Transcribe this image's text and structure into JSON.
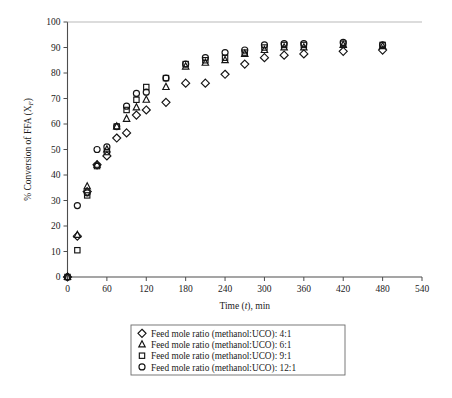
{
  "chart_data": {
    "type": "scatter",
    "title": "",
    "xlabel": "Time (t), min",
    "ylabel": "% Conversion of FFA (XF)",
    "ylabel_main": "% Conversion of FFA (X",
    "ylabel_sub": "F",
    "ylabel_tail": ")",
    "xlabel_pre": "Time (",
    "xlabel_it": "t",
    "xlabel_post": "), min",
    "xlim": [
      0,
      540
    ],
    "ylim": [
      0,
      100
    ],
    "xticks": [
      0,
      60,
      120,
      180,
      240,
      300,
      360,
      420,
      480,
      540
    ],
    "yticks": [
      0,
      10,
      20,
      30,
      40,
      50,
      60,
      70,
      80,
      90,
      100
    ],
    "grid": false,
    "legend_position": "below-plot",
    "series": [
      {
        "name": "Feed mole ratio (methanol:UCO): 4:1",
        "label_pre": "Feed mole ratio (methanol:UCO): ",
        "ratio": "4:1",
        "marker": "diamond",
        "points": [
          {
            "x": 0,
            "y": 0
          },
          {
            "x": 15,
            "y": 16
          },
          {
            "x": 30,
            "y": 33.5
          },
          {
            "x": 45,
            "y": 44
          },
          {
            "x": 60,
            "y": 47.5
          },
          {
            "x": 75,
            "y": 54.5
          },
          {
            "x": 90,
            "y": 56.5
          },
          {
            "x": 105,
            "y": 63.5
          },
          {
            "x": 120,
            "y": 65.5
          },
          {
            "x": 150,
            "y": 68.5
          },
          {
            "x": 180,
            "y": 76
          },
          {
            "x": 210,
            "y": 76
          },
          {
            "x": 240,
            "y": 79.5
          },
          {
            "x": 270,
            "y": 83.5
          },
          {
            "x": 300,
            "y": 86
          },
          {
            "x": 330,
            "y": 87
          },
          {
            "x": 360,
            "y": 87.5
          },
          {
            "x": 420,
            "y": 88.5
          },
          {
            "x": 480,
            "y": 89
          }
        ]
      },
      {
        "name": "Feed mole ratio (methanol:UCO): 6:1",
        "label_pre": "Feed mole ratio (methanol:UCO): ",
        "ratio": "6:1",
        "marker": "triangle",
        "points": [
          {
            "x": 0,
            "y": 0
          },
          {
            "x": 15,
            "y": 16.5
          },
          {
            "x": 30,
            "y": 35.5
          },
          {
            "x": 45,
            "y": 44
          },
          {
            "x": 60,
            "y": 50
          },
          {
            "x": 75,
            "y": 59
          },
          {
            "x": 90,
            "y": 62
          },
          {
            "x": 105,
            "y": 66.5
          },
          {
            "x": 120,
            "y": 69.5
          },
          {
            "x": 150,
            "y": 74.5
          },
          {
            "x": 180,
            "y": 82.5
          },
          {
            "x": 210,
            "y": 84
          },
          {
            "x": 240,
            "y": 85
          },
          {
            "x": 270,
            "y": 87.5
          },
          {
            "x": 300,
            "y": 89
          },
          {
            "x": 330,
            "y": 90
          },
          {
            "x": 360,
            "y": 90
          },
          {
            "x": 420,
            "y": 91
          },
          {
            "x": 480,
            "y": 90.5
          }
        ]
      },
      {
        "name": "Feed mole ratio (methanol:UCO): 9:1",
        "label_pre": "Feed mole ratio (methanol:UCO): ",
        "ratio": "9:1",
        "marker": "square",
        "points": [
          {
            "x": 0,
            "y": 0
          },
          {
            "x": 15,
            "y": 10.5
          },
          {
            "x": 30,
            "y": 32
          },
          {
            "x": 45,
            "y": 43.5
          },
          {
            "x": 60,
            "y": 49
          },
          {
            "x": 75,
            "y": 59
          },
          {
            "x": 90,
            "y": 65.5
          },
          {
            "x": 105,
            "y": 69.5
          },
          {
            "x": 120,
            "y": 74.5
          },
          {
            "x": 150,
            "y": 78
          },
          {
            "x": 180,
            "y": 83.5
          },
          {
            "x": 210,
            "y": 85
          },
          {
            "x": 240,
            "y": 86
          },
          {
            "x": 270,
            "y": 88
          },
          {
            "x": 300,
            "y": 90
          },
          {
            "x": 330,
            "y": 91
          },
          {
            "x": 360,
            "y": 91
          },
          {
            "x": 420,
            "y": 91.5
          },
          {
            "x": 480,
            "y": 91
          }
        ]
      },
      {
        "name": "Feed mole ratio (methanol:UCO): 12:1",
        "label_pre": "Feed mole ratio (methanol:UCO): ",
        "ratio": "12:1",
        "marker": "circle",
        "points": [
          {
            "x": 0,
            "y": 0
          },
          {
            "x": 15,
            "y": 28
          },
          {
            "x": 30,
            "y": 33
          },
          {
            "x": 45,
            "y": 50
          },
          {
            "x": 60,
            "y": 51
          },
          {
            "x": 75,
            "y": 59
          },
          {
            "x": 90,
            "y": 67
          },
          {
            "x": 105,
            "y": 72
          },
          {
            "x": 120,
            "y": 72.5
          },
          {
            "x": 150,
            "y": 78
          },
          {
            "x": 180,
            "y": 83.5
          },
          {
            "x": 210,
            "y": 86
          },
          {
            "x": 240,
            "y": 88
          },
          {
            "x": 270,
            "y": 89
          },
          {
            "x": 300,
            "y": 91
          },
          {
            "x": 330,
            "y": 91.5
          },
          {
            "x": 360,
            "y": 91.5
          },
          {
            "x": 420,
            "y": 92
          },
          {
            "x": 480,
            "y": 91
          }
        ]
      }
    ]
  },
  "legend": {
    "items": [
      {
        "marker": "diamond",
        "text": "Feed mole ratio (methanol:UCO): 4:1"
      },
      {
        "marker": "triangle",
        "text": "Feed mole ratio (methanol:UCO): 6:1"
      },
      {
        "marker": "square",
        "text": "Feed mole ratio (methanol:UCO): 9:1"
      },
      {
        "marker": "circle",
        "text": "Feed mole ratio (methanol:UCO): 12:1"
      }
    ]
  },
  "colors": {
    "marker_stroke": "#141414",
    "axis": "#4d4d4d",
    "text": "#1a1a1a",
    "background": "#ffffff",
    "legend_border": "#6b6b6b"
  }
}
